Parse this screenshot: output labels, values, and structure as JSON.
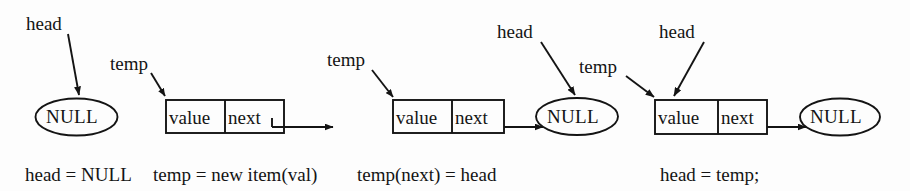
{
  "figure": {
    "stroke_color": "#141414",
    "background_color": "#fdfdfd",
    "width": 910,
    "height": 191
  },
  "stages": [
    {
      "id": "stage-1",
      "caption": "head = NULL",
      "pointers": [
        {
          "name": "head",
          "label": "head",
          "target": "null-ellipse-1"
        }
      ],
      "null_nodes": [
        {
          "id": "null-ellipse-1",
          "label": "NULL"
        }
      ],
      "nodes": []
    },
    {
      "id": "stage-2",
      "caption": "temp = new item(val)",
      "pointers": [
        {
          "name": "temp",
          "label": "temp",
          "target": "node-1"
        }
      ],
      "null_nodes": [],
      "nodes": [
        {
          "id": "node-1",
          "value_label": "value",
          "next_label": "next",
          "next_points_to": "dangling"
        }
      ]
    },
    {
      "id": "stage-3",
      "caption": "temp(next) = head",
      "pointers": [
        {
          "name": "temp",
          "label": "temp",
          "target": "node-2"
        },
        {
          "name": "head",
          "label": "head",
          "target": "null-ellipse-2"
        }
      ],
      "null_nodes": [
        {
          "id": "null-ellipse-2",
          "label": "NULL"
        }
      ],
      "nodes": [
        {
          "id": "node-2",
          "value_label": "value",
          "next_label": "next",
          "next_points_to": "null-ellipse-2"
        }
      ]
    },
    {
      "id": "stage-4",
      "caption": "head = temp;",
      "pointers": [
        {
          "name": "temp",
          "label": "temp",
          "target": "node-3"
        },
        {
          "name": "head",
          "label": "head",
          "target": "node-3"
        }
      ],
      "null_nodes": [
        {
          "id": "null-ellipse-3",
          "label": "NULL"
        }
      ],
      "nodes": [
        {
          "id": "node-3",
          "value_label": "value",
          "next_label": "next",
          "next_points_to": "null-ellipse-3"
        }
      ]
    }
  ],
  "labels": {
    "head_1": "head",
    "temp_1": "temp",
    "temp_2": "temp",
    "head_2": "head",
    "temp_3": "temp",
    "head_3": "head",
    "null_1": "NULL",
    "null_2": "NULL",
    "null_3": "NULL",
    "node1_value": "value",
    "node1_next": "next",
    "node2_value": "value",
    "node2_next": "next",
    "node3_value": "value",
    "node3_next": "next"
  },
  "caption": {
    "seg1": "head = NULL",
    "seg2": "temp = new item(val)",
    "seg3": "temp(next) = head",
    "seg4": "head = temp;",
    "full": "head = NULL  temp = new item(val)  temp(next) = head        head = temp;"
  }
}
